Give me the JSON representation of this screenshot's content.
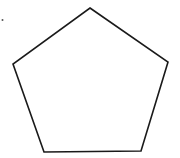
{
  "diagram": {
    "shape": "pentagon",
    "stroke_color": "#1a1a1a",
    "fill_color": "#ffffff",
    "stroke_width": 1.6,
    "vertices": [
      {
        "name": "top",
        "x": 90,
        "y": 8
      },
      {
        "name": "right",
        "x": 168,
        "y": 62
      },
      {
        "name": "bottom-right",
        "x": 141,
        "y": 151
      },
      {
        "name": "bottom-left",
        "x": 44,
        "y": 152
      },
      {
        "name": "left",
        "x": 13,
        "y": 64
      }
    ],
    "marker_dot": {
      "x": 2.5,
      "y": 20,
      "r": 1,
      "color": "#555555"
    }
  }
}
